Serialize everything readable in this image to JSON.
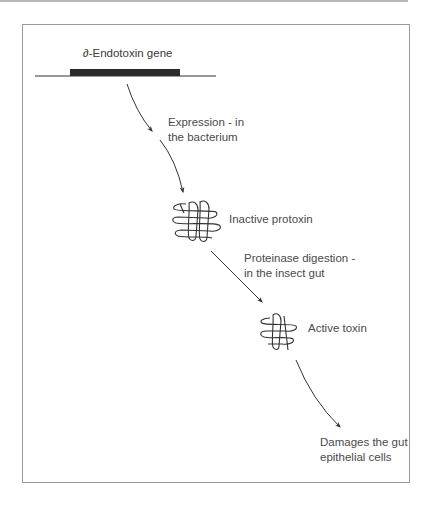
{
  "figure": {
    "colors": {
      "ink": "#333333",
      "gene_bar": "#2a2a2a",
      "text": "#4a4a4a",
      "frame": "#9a9a9a"
    }
  },
  "gene": {
    "label": "∂-Endotoxin gene"
  },
  "steps": [
    {
      "id": "expression",
      "lines": [
        "Expression - in",
        "the bacterium"
      ]
    },
    {
      "id": "proteinase",
      "lines": [
        "Proteinase digestion -",
        "in the insect gut"
      ]
    },
    {
      "id": "damage",
      "lines": [
        "Damages the gut",
        "epithelial cells"
      ]
    }
  ],
  "states": [
    {
      "id": "protoxin",
      "label": "Inactive protoxin",
      "icon": "tangled-protein-icon-large"
    },
    {
      "id": "toxin",
      "label": "Active toxin",
      "icon": "tangled-protein-icon-small"
    }
  ]
}
